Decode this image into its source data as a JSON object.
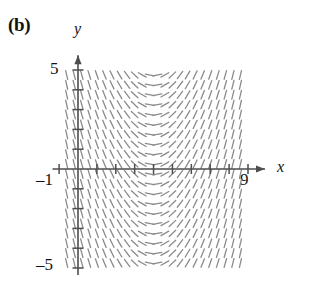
{
  "figure": {
    "panel_label": "(b)",
    "axis_names": {
      "x": "x",
      "y": "y"
    },
    "tick_labels": {
      "y_top": "5",
      "y_bottom": "–5",
      "x_left": "–1",
      "x_right": "9"
    }
  },
  "chart_data": {
    "type": "scatter",
    "subtype": "slope-field",
    "title": "",
    "xlabel": "x",
    "ylabel": "y",
    "xlim": [
      -1,
      9
    ],
    "ylim": [
      -5,
      5
    ],
    "grid": false,
    "legend": null,
    "axis_style": {
      "x_axis_y_value": 0,
      "y_axis_x_value": 0,
      "arrowheads": [
        "x-positive",
        "y-positive"
      ],
      "tick_spacing_x": 1,
      "tick_spacing_y": 1,
      "x_tick_values": [
        -1,
        0,
        1,
        2,
        3,
        4,
        5,
        6,
        7,
        8,
        9
      ],
      "y_tick_values": [
        -5,
        -4,
        -3,
        -2,
        -1,
        0,
        1,
        2,
        3,
        4,
        5
      ],
      "labeled_x_ticks": [
        -1,
        9
      ],
      "labeled_y_ticks": [
        -5,
        5
      ]
    },
    "field": {
      "description": "Direction field of dy/dx depending only on x; slope is steeply negative near x=0, flattens to zero near x=4, and becomes steeply positive toward x=9.",
      "slope_formula": "m = 0.9*(x - 4)",
      "x_samples": [
        -0.6,
        -0.2,
        0.2,
        0.6,
        1.0,
        1.4,
        1.8,
        2.2,
        2.6,
        3.0,
        3.4,
        3.8,
        4.2,
        4.6,
        5.0,
        5.4,
        5.8,
        6.2,
        6.6,
        7.0,
        7.4,
        7.8,
        8.2,
        8.6
      ],
      "y_samples": [
        -4.75,
        -4.25,
        -3.75,
        -3.25,
        -2.75,
        -2.25,
        -1.75,
        -1.25,
        -0.75,
        -0.25,
        0.25,
        0.75,
        1.25,
        1.75,
        2.25,
        2.75,
        3.25,
        3.75,
        4.25,
        4.75
      ],
      "slope_at_x": [
        -4.14,
        -3.78,
        -3.42,
        -3.06,
        -2.7,
        -2.34,
        -1.98,
        -1.62,
        -1.26,
        -0.9,
        -0.54,
        -0.18,
        0.18,
        0.54,
        0.9,
        1.26,
        1.62,
        1.98,
        2.34,
        2.7,
        3.06,
        3.42,
        3.78,
        4.14
      ],
      "tick_length_px": 9,
      "stroke_color": "#8b8b8b",
      "stroke_width": 1.3
    },
    "colors": {
      "axis": "#4d4d4d",
      "field": "#8b8b8b",
      "text": "#131313",
      "background": "#ffffff"
    }
  }
}
